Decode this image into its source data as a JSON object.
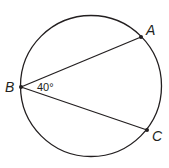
{
  "diagram": {
    "type": "inscribed-angle",
    "points": [
      {
        "id": "A",
        "label": "A"
      },
      {
        "id": "B",
        "label": "B"
      },
      {
        "id": "C",
        "label": "C"
      }
    ],
    "angle": {
      "vertex": "B",
      "label": "40°",
      "value_deg": 40
    },
    "segments": [
      {
        "from": "B",
        "to": "A"
      },
      {
        "from": "B",
        "to": "C"
      }
    ],
    "colors": {
      "stroke": "#231f20",
      "background": "#ffffff"
    }
  }
}
